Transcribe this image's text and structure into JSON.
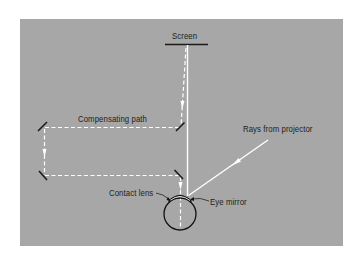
{
  "diagram": {
    "title": "",
    "colors": {
      "panel": "#a7a7a7",
      "ray": "#ffffff",
      "mirror": "#1a1a1a",
      "label": "#1e1e1e"
    },
    "labels": {
      "screen": "Screen",
      "compensating_path": "Compensating path",
      "rays_from_projector": "Rays from projector",
      "contact_lens": "Contact lens",
      "eye_mirror": "Eye mirror"
    },
    "elements": [
      {
        "id": "screen",
        "type": "bar"
      },
      {
        "id": "mirror-top-left",
        "type": "mirror"
      },
      {
        "id": "mirror-top-right",
        "type": "mirror"
      },
      {
        "id": "mirror-bottom-left",
        "type": "mirror"
      },
      {
        "id": "mirror-bottom-right",
        "type": "mirror"
      },
      {
        "id": "eye",
        "type": "circle"
      },
      {
        "id": "contact-lens",
        "type": "arc"
      },
      {
        "id": "eye-mirror",
        "type": "arc"
      }
    ],
    "edges": [
      {
        "from": "screen",
        "to": "mirror-top-right",
        "style": "dashed",
        "arrow": true
      },
      {
        "from": "mirror-top-right",
        "to": "mirror-top-left",
        "style": "dashed",
        "label": "Compensating path"
      },
      {
        "from": "mirror-top-left",
        "to": "mirror-bottom-left",
        "style": "dashed",
        "arrow": true
      },
      {
        "from": "mirror-bottom-left",
        "to": "mirror-bottom-right",
        "style": "dashed"
      },
      {
        "from": "mirror-bottom-right",
        "to": "eye",
        "style": "dashed",
        "arrow": true
      },
      {
        "from": "projector",
        "to": "eye-mirror",
        "style": "solid",
        "arrow": true,
        "label": "Rays from projector"
      },
      {
        "from": "eye-mirror",
        "to": "screen",
        "style": "solid"
      }
    ]
  }
}
